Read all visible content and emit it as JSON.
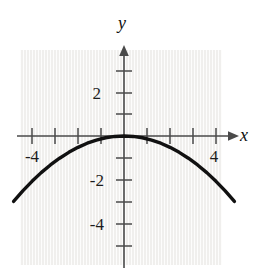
{
  "figure": {
    "label": ")",
    "background_color": "#ffffff",
    "plot_background_color": "#f0efed",
    "curve_color": "#111111",
    "axis_color": "#4a4a4a"
  },
  "axes": {
    "x_axis_name": "x",
    "y_axis_name": "y"
  },
  "chart_data": {
    "type": "line",
    "title": "",
    "subtitle": "",
    "xlabel": "x",
    "ylabel": "y",
    "xlim": [
      -5,
      5
    ],
    "ylim": [
      -5,
      3
    ],
    "grid": false,
    "legend": null,
    "x_tick_labels": [
      "-4",
      "4"
    ],
    "y_tick_labels": [
      "2",
      "-2",
      "-4"
    ],
    "x_ticks": [
      -4,
      -3,
      -2,
      -1,
      1,
      2,
      3,
      4
    ],
    "y_ticks": [
      2.5,
      2,
      1.5,
      1,
      0.5,
      -0.5,
      -1,
      -1.5,
      -2,
      -2.5,
      -3,
      -3.5,
      -4,
      -4.5
    ],
    "x_tick_interval": 1,
    "y_tick_interval": 0.5,
    "annotations": [],
    "series": [
      {
        "name": "downward parabola",
        "equation": "y = -0.13 x^2",
        "vertex": [
          0,
          0
        ],
        "x": [
          -4.8,
          -4.4,
          -4.0,
          -3.6,
          -3.2,
          -2.8,
          -2.4,
          -2.0,
          -1.6,
          -1.2,
          -0.8,
          -0.4,
          0.0,
          0.4,
          0.8,
          1.2,
          1.6,
          2.0,
          2.4,
          2.8,
          3.2,
          3.6,
          4.0,
          4.4,
          4.8
        ],
        "values": [
          -3.0,
          -2.52,
          -2.08,
          -1.68,
          -1.33,
          -1.02,
          -0.75,
          -0.52,
          -0.33,
          -0.19,
          -0.08,
          -0.02,
          0.0,
          -0.02,
          -0.08,
          -0.19,
          -0.33,
          -0.52,
          -0.75,
          -1.02,
          -1.33,
          -1.68,
          -2.08,
          -2.52,
          -3.0
        ]
      }
    ]
  }
}
